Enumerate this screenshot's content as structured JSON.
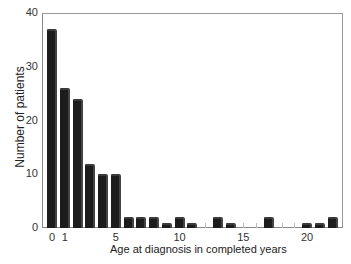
{
  "chart_data": {
    "type": "bar",
    "title": "",
    "xlabel": "Age at diagnosis in completed years",
    "ylabel": "Number of patients",
    "ylim": [
      0,
      40
    ],
    "yticks": [
      0,
      10,
      20,
      30,
      40
    ],
    "xticks": [
      0,
      1,
      5,
      10,
      15,
      20
    ],
    "grid": false,
    "legend": null,
    "categories": [
      0,
      1,
      2,
      3,
      4,
      5,
      6,
      7,
      8,
      9,
      10,
      11,
      12,
      13,
      14,
      15,
      16,
      17,
      18,
      19,
      20,
      21,
      22
    ],
    "values": [
      37,
      26,
      24,
      12,
      10,
      10,
      2,
      2,
      2,
      1,
      2,
      1,
      0,
      2,
      1,
      0,
      0,
      2,
      0,
      0,
      1,
      1,
      2
    ]
  },
  "labels": {
    "ylabel": "Number of patients",
    "xlabel": "Age at diagnosis in completed years"
  }
}
